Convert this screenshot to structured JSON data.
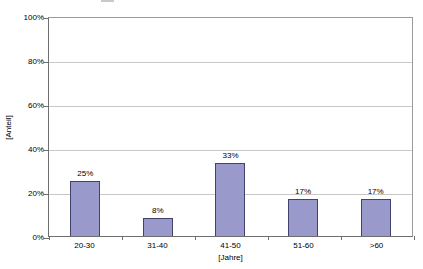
{
  "chart_data": {
    "type": "bar",
    "title": "",
    "categories": [
      "20-30",
      "31-40",
      "41-50",
      "51-60",
      ">60"
    ],
    "values": [
      25,
      8,
      33,
      17,
      17
    ],
    "value_labels": [
      "25%",
      "8%",
      "33%",
      "17%",
      "17%"
    ],
    "xlabel": "[Jahre]",
    "ylabel": "[Anteil]",
    "ylim": [
      0,
      100
    ],
    "ytick_step": 20,
    "ytick_labels": [
      "0%",
      "20%",
      "40%",
      "60%",
      "80%",
      "100%"
    ],
    "grid": true,
    "legend": "none",
    "colors": {
      "bar_fill": "#9999CB",
      "bar_border": "#42426F",
      "gridline": "#C8C8C8",
      "plot_border": "#999999",
      "axis_line": "#6E6E6E",
      "background": "#FFFFFF",
      "text": "#000000"
    }
  }
}
